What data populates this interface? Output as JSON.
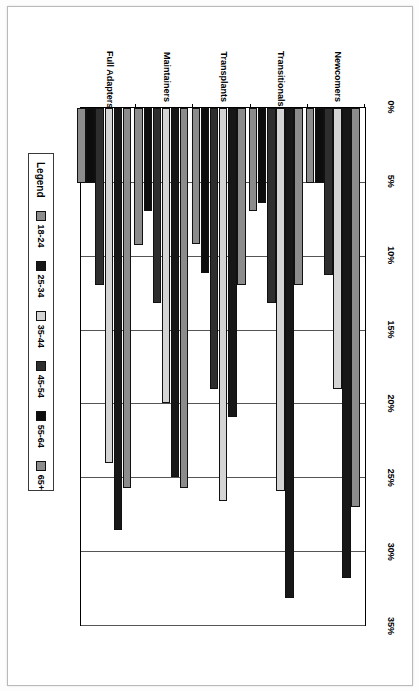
{
  "chart_data": {
    "type": "bar",
    "orientation": "horizontal",
    "title": "",
    "xlabel": "",
    "ylabel": "",
    "xlim": [
      0,
      35
    ],
    "grid": true,
    "legend_position": "bottom-left",
    "legend_title": "Legend",
    "tick_labels": [
      "0%",
      "5%",
      "10%",
      "15%",
      "20%",
      "25%",
      "30%",
      "35%"
    ],
    "tick_values": [
      0,
      5,
      10,
      15,
      20,
      25,
      30,
      35
    ],
    "categories": [
      "Newcomers",
      "Transitionals",
      "Transplants",
      "Maintainers",
      "Full Adapters"
    ],
    "series": [
      {
        "name": "18-24",
        "color": "#8c8c8c",
        "values": [
          27.0,
          12.0,
          12.0,
          25.7,
          25.7
        ]
      },
      {
        "name": "25-34",
        "color": "#171717",
        "values": [
          31.8,
          33.2,
          20.9,
          25.0,
          28.6
        ]
      },
      {
        "name": "35-44",
        "color": "#d4d4d4",
        "values": [
          19.0,
          25.9,
          26.6,
          20.0,
          24.0
        ]
      },
      {
        "name": "45-54",
        "color": "#2e2e2e",
        "values": [
          11.3,
          13.2,
          19.0,
          13.2,
          12.0
        ]
      },
      {
        "name": "55-64",
        "color": "#0d0d0d",
        "values": [
          5.1,
          6.4,
          11.2,
          7.0,
          5.1
        ]
      },
      {
        "name": "65+",
        "color": "#8c8c8c",
        "values": [
          5.1,
          7.0,
          9.2,
          9.3,
          5.1
        ]
      }
    ]
  }
}
